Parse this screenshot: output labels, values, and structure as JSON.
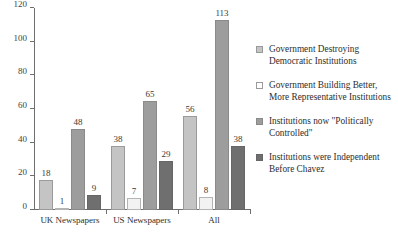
{
  "chart_data": {
    "type": "bar",
    "title": "",
    "subtitle": "",
    "xlabel": "",
    "ylabel": "",
    "ylim": [
      0,
      120
    ],
    "yticks": [
      0,
      20,
      40,
      60,
      80,
      100,
      120
    ],
    "grid": false,
    "legend_position": "right",
    "categories": [
      "UK Newspapers",
      "US Newspapers",
      "All"
    ],
    "series": [
      {
        "name": "Government Destroying Democratic Institutions",
        "color": "#c4c4c4",
        "values": [
          18,
          38,
          56
        ]
      },
      {
        "name": "Government Building Better, More Representative Institutions",
        "color": "#ffffff",
        "values": [
          1,
          7,
          8
        ]
      },
      {
        "name": "Institutions now \"Politically Controlled\"",
        "color": "#9d9d9d",
        "values": [
          48,
          65,
          113
        ]
      },
      {
        "name": "Institutions were Independent Before Chavez",
        "color": "#6f6f6f",
        "values": [
          9,
          29,
          38
        ]
      }
    ]
  }
}
